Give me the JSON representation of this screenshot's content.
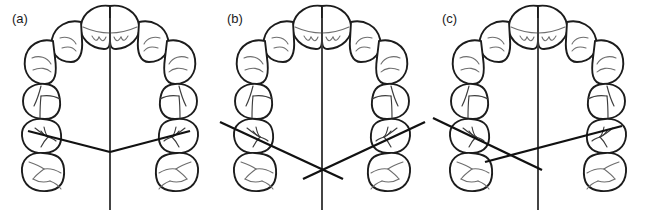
{
  "figure": {
    "name": "dental-arch-midline-figure",
    "background_color": "#ffffff",
    "width": 645,
    "height": 220,
    "stroke_color": "#1c1c1c",
    "detail_color": "#6e6e6e",
    "line_color": "#111111"
  },
  "panels": [
    {
      "id": "a",
      "label": "(a)",
      "description": "Symmetric maxillary arch with both posterior reference lines meeting on the midline",
      "midline": {
        "x": 110,
        "y1": 18,
        "y2": 210
      },
      "reference_lines": [
        {
          "name": "left-posterior-line",
          "x1": 28,
          "y1": 131,
          "x2": 110,
          "y2": 152
        },
        {
          "name": "right-posterior-line",
          "x1": 110,
          "y1": 152,
          "x2": 190,
          "y2": 131
        }
      ]
    },
    {
      "id": "b",
      "label": "(b)",
      "description": "Symmetric arch with both reference lines crossing each other on the midline below the arch",
      "midline": {
        "x": 107,
        "y1": 18,
        "y2": 210
      },
      "reference_lines": [
        {
          "name": "left-posterior-line",
          "x1": 5,
          "y1": 122,
          "x2": 128,
          "y2": 179
        },
        {
          "name": "right-posterior-line",
          "x1": 210,
          "y1": 122,
          "x2": 88,
          "y2": 179
        }
      ]
    },
    {
      "id": "c",
      "label": "(c)",
      "description": "Asymmetric arch with the reference lines crossing off the midline on the left side",
      "midline": {
        "x": 108,
        "y1": 18,
        "y2": 210
      },
      "reference_lines": [
        {
          "name": "left-posterior-line",
          "x1": 3,
          "y1": 118,
          "x2": 112,
          "y2": 170
        },
        {
          "name": "right-posterior-line",
          "x1": 192,
          "y1": 126,
          "x2": 55,
          "y2": 162
        }
      ]
    }
  ],
  "arch": {
    "tooth_names": [
      "upper-right-central-incisor",
      "upper-left-central-incisor",
      "upper-right-lateral-incisor",
      "upper-left-lateral-incisor",
      "upper-right-canine",
      "upper-left-canine",
      "upper-right-first-premolar",
      "upper-left-first-premolar",
      "upper-right-second-premolar",
      "upper-left-second-premolar",
      "upper-right-first-molar",
      "upper-left-first-molar"
    ],
    "tooth_count": 12
  }
}
